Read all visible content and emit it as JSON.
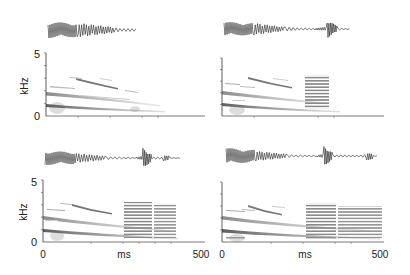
{
  "chart_data": [
    {
      "type": "heatmap",
      "panel": "top-left",
      "title": "",
      "xlabel": "",
      "ylabel": "kHz",
      "yticks": [
        "0",
        "5"
      ],
      "xlim": [
        0,
        500
      ],
      "ylim": [
        0,
        5
      ],
      "description": "Waveform above a spectrogram of a single descending harmonic note (~0-300 ms)",
      "waveform_extent_ms": [
        0,
        300
      ],
      "harmonic_bands": [
        {
          "start_khz": 1.1,
          "end_khz": 0.6,
          "start_ms": 0,
          "end_ms": 310
        },
        {
          "start_khz": 2.2,
          "end_khz": 1.0,
          "start_ms": 0,
          "end_ms": 300
        },
        {
          "start_khz": 3.3,
          "end_khz": 2.2,
          "start_ms": 30,
          "end_ms": 270
        }
      ],
      "noise_bursts": []
    },
    {
      "type": "heatmap",
      "panel": "top-right",
      "xlabel": "",
      "ylabel": "",
      "xlim": [
        0,
        500
      ],
      "ylim": [
        0,
        5
      ],
      "description": "Descending harmonic note followed by a broadband pulsed element (~260-320 ms)",
      "waveform_extent_ms": [
        0,
        340
      ],
      "harmonic_bands": [
        {
          "start_khz": 1.1,
          "end_khz": 0.6,
          "start_ms": 0,
          "end_ms": 320
        },
        {
          "start_khz": 2.2,
          "end_khz": 1.0,
          "start_ms": 0,
          "end_ms": 310
        },
        {
          "start_khz": 3.3,
          "end_khz": 2.2,
          "start_ms": 50,
          "end_ms": 200
        }
      ],
      "noise_bursts": [
        {
          "start_ms": 260,
          "end_ms": 320,
          "low_khz": 0.4,
          "high_khz": 3.3
        }
      ]
    },
    {
      "type": "heatmap",
      "panel": "bottom-left",
      "xlabel": "ms",
      "ylabel": "kHz",
      "xticks": [
        "0",
        "500"
      ],
      "yticks": [
        "0",
        "5"
      ],
      "xlim": [
        0,
        500
      ],
      "ylim": [
        0,
        5
      ],
      "description": "Descending harmonic note followed by two broadband pulsed elements",
      "waveform_extent_ms": [
        0,
        410
      ],
      "harmonic_bands": [
        {
          "start_khz": 1.1,
          "end_khz": 0.6,
          "start_ms": 0,
          "end_ms": 420
        },
        {
          "start_khz": 2.0,
          "end_khz": 1.0,
          "start_ms": 0,
          "end_ms": 400
        },
        {
          "start_khz": 3.2,
          "end_khz": 2.4,
          "start_ms": 50,
          "end_ms": 220
        }
      ],
      "noise_bursts": [
        {
          "start_ms": 260,
          "end_ms": 340,
          "low_khz": 0.4,
          "high_khz": 3.3
        },
        {
          "start_ms": 350,
          "end_ms": 410,
          "low_khz": 0.4,
          "high_khz": 3.1
        }
      ]
    },
    {
      "type": "heatmap",
      "panel": "bottom-right",
      "xlabel": "ms",
      "ylabel": "",
      "xticks": [
        "0",
        "500"
      ],
      "xlim": [
        0,
        500
      ],
      "ylim": [
        0,
        5
      ],
      "description": "Descending harmonic note followed by three broadband pulsed elements",
      "waveform_extent_ms": [
        0,
        480
      ],
      "harmonic_bands": [
        {
          "start_khz": 1.1,
          "end_khz": 0.6,
          "start_ms": 0,
          "end_ms": 480
        },
        {
          "start_khz": 2.2,
          "end_khz": 1.0,
          "start_ms": 0,
          "end_ms": 460
        },
        {
          "start_khz": 3.3,
          "end_khz": 2.4,
          "start_ms": 70,
          "end_ms": 230
        }
      ],
      "noise_bursts": [
        {
          "start_ms": 250,
          "end_ms": 330,
          "low_khz": 0.4,
          "high_khz": 3.3
        },
        {
          "start_ms": 340,
          "end_ms": 400,
          "low_khz": 0.4,
          "high_khz": 3.1
        },
        {
          "start_ms": 410,
          "end_ms": 480,
          "low_khz": 0.4,
          "high_khz": 3.1
        }
      ]
    }
  ],
  "labels": {
    "y_unit": "kHz",
    "x_unit": "ms",
    "y_max": "5",
    "y_min": "0",
    "x_min": "0",
    "x_max": "500"
  }
}
